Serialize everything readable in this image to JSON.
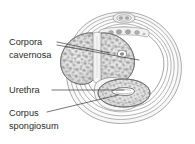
{
  "figure": {
    "type": "anatomical-cross-section",
    "background_color": "#ffffff",
    "line_color": "#3a3a3a",
    "text_color": "#2b2b2b"
  },
  "labels": [
    {
      "id": "corpora-cavernosa",
      "line1": "Corpora",
      "line2": "cavernosa",
      "x": 9,
      "y": 45,
      "leader_count": 2
    },
    {
      "id": "urethra",
      "line1": "Urethra",
      "line2": "",
      "x": 9,
      "y": 93,
      "leader_count": 1
    },
    {
      "id": "corpus-spongiosum",
      "line1": "Corpus",
      "line2": "spongiosum",
      "x": 9,
      "y": 116,
      "leader_count": 1
    }
  ],
  "structures": [
    {
      "id": "tunica-layers",
      "name": "concentric fascial layers",
      "count": 6
    },
    {
      "id": "corpus-cavernosum-left",
      "name": "left corpus cavernosum"
    },
    {
      "id": "corpus-cavernosum-right",
      "name": "right corpus cavernosum"
    },
    {
      "id": "septum",
      "name": "median septum"
    },
    {
      "id": "corpus-spongiosum-body",
      "name": "corpus spongiosum"
    },
    {
      "id": "urethra-lumen",
      "name": "urethral lumen"
    },
    {
      "id": "dorsal-vessels",
      "name": "dorsal vessels and nerve"
    }
  ]
}
